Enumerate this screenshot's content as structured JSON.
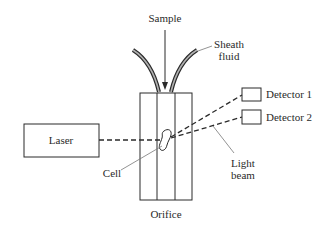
{
  "diagram": {
    "type": "flow-cytometer-schematic",
    "labels": {
      "sample": "Sample",
      "sheath_line1": "Sheath",
      "sheath_line2": "fluid",
      "laser": "Laser",
      "detector1": "Detector 1",
      "detector2": "Detector 2",
      "light_line1": "Light",
      "light_line2": "beam",
      "cell": "Cell",
      "orifice": "Orifice"
    },
    "colors": {
      "stroke": "#2a2a2a",
      "tube_fill": "#9a9a9a",
      "leader": "#777777",
      "background": "#ffffff"
    },
    "components": [
      {
        "id": "sample-inlet",
        "label": "Sample"
      },
      {
        "id": "sheath-tubes",
        "label": "Sheath fluid"
      },
      {
        "id": "laser",
        "label": "Laser"
      },
      {
        "id": "orifice",
        "label": "Orifice"
      },
      {
        "id": "cell",
        "label": "Cell"
      },
      {
        "id": "detector-1",
        "label": "Detector 1"
      },
      {
        "id": "detector-2",
        "label": "Detector 2"
      },
      {
        "id": "light-beam",
        "label": "Light beam"
      }
    ]
  }
}
